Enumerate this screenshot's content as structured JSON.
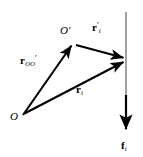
{
  "figure": {
    "kind": "vector-diagram",
    "width": 143,
    "height": 157,
    "background_color": "#ffffff",
    "stroke_color": "#000000",
    "guide_color": "#808080"
  },
  "points": {
    "origin": {
      "label": "O",
      "x": 22,
      "y": 117
    },
    "origin_prime": {
      "label": "O",
      "prime": "′",
      "x": 74,
      "y": 43
    },
    "particle": {
      "x": 125,
      "y": 60
    }
  },
  "guide_line": {
    "name": "vertical-reference-line",
    "x": 126,
    "y_top": 12,
    "y_bottom": 130,
    "color": "#808080"
  },
  "vectors": [
    {
      "id": "r-oo-prime",
      "symbol": "r",
      "subscript": "OO′",
      "prime": "",
      "from_x": 23,
      "from_y": 115,
      "to_x": 73,
      "to_y": 44,
      "label_text": "r"
    },
    {
      "id": "r-i-prime",
      "symbol": "r",
      "subscript": "i",
      "prime": "′",
      "from_x": 76,
      "from_y": 45,
      "to_x": 125,
      "to_y": 58,
      "label_text": "r"
    },
    {
      "id": "r-i",
      "symbol": "r",
      "subscript": "i",
      "prime": "",
      "from_x": 24,
      "from_y": 114,
      "to_x": 125,
      "to_y": 62,
      "label_text": "r"
    },
    {
      "id": "f-i",
      "symbol": "f",
      "subscript": "i",
      "prime": "",
      "from_x": 126,
      "from_y": 95,
      "to_x": 126,
      "to_y": 132,
      "label_text": "f"
    }
  ],
  "labels": {
    "origin": "O",
    "origin_prime": "O",
    "origin_prime_mark": "′",
    "r_oo_prime_symbol": "r",
    "r_oo_prime_sub": "OO",
    "r_oo_prime_mark": "′",
    "r_i_prime_symbol": "r",
    "r_i_prime_sub": "i",
    "r_i_prime_mark": "′",
    "r_i_symbol": "r",
    "r_i_sub": "i",
    "f_i_symbol": "f",
    "f_i_sub": "i"
  }
}
